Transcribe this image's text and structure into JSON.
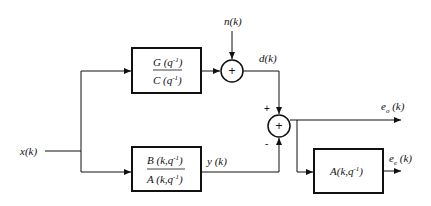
{
  "diagram": {
    "input_label": "x(k)",
    "noise_label": "n(k)",
    "desired_label": "d(k)",
    "output_label": "y (k)",
    "error_out_label": "e",
    "error_out_sub": "o",
    "error_out_arg": " (k)",
    "error_e_label": "e",
    "error_e_sub": "e",
    "error_e_arg": " (k)",
    "block_top": {
      "num": "G (q",
      "num_exp": "-1",
      "num_close": ")",
      "den": "C (q",
      "den_exp": "-1",
      "den_close": ")"
    },
    "block_bottom": {
      "num": "B (k,q",
      "num_exp": "-1",
      "num_close": ")",
      "den": "A (k,q",
      "den_exp": "-1",
      "den_close": ")"
    },
    "block_right": {
      "text": "A(k,q",
      "exp": "-1",
      "close": ")"
    },
    "sum1_symbol": "+",
    "sum2_symbol": "+",
    "sum2_plus": "+",
    "sum2_minus": "-",
    "colors": {
      "line": "#111111",
      "background": "#ffffff"
    }
  }
}
